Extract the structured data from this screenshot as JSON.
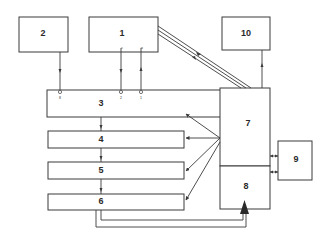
{
  "diagram": {
    "type": "block-diagram",
    "colors": {
      "stroke": "#3a3a3a",
      "background": "#ffffff",
      "text": "#2a2a2a"
    },
    "blocks": [
      {
        "id": "1",
        "label": "1"
      },
      {
        "id": "2",
        "label": "2"
      },
      {
        "id": "3",
        "label": "3"
      },
      {
        "id": "4",
        "label": "4"
      },
      {
        "id": "5",
        "label": "5"
      },
      {
        "id": "6",
        "label": "6"
      },
      {
        "id": "7",
        "label": "7"
      },
      {
        "id": "8",
        "label": "8"
      },
      {
        "id": "9",
        "label": "9"
      },
      {
        "id": "10",
        "label": "10"
      }
    ],
    "ports": {
      "p8": "8",
      "p2": "2",
      "p1": "1",
      "p_src_c": "c",
      "p_src_d": "o"
    },
    "connections": [
      {
        "from": "2",
        "to": "3",
        "port": "8"
      },
      {
        "from": "1",
        "to": "3",
        "port": "2"
      },
      {
        "from": "1",
        "to": "3",
        "port": "1"
      },
      {
        "from": "1",
        "to": "7",
        "bus": 3,
        "bidirectional": true
      },
      {
        "from": "7",
        "to": "10"
      },
      {
        "from": "7",
        "to": "3"
      },
      {
        "from": "7",
        "to": "4"
      },
      {
        "from": "7",
        "to": "5"
      },
      {
        "from": "7",
        "to": "6"
      },
      {
        "from": "3",
        "to": "4"
      },
      {
        "from": "4",
        "to": "5"
      },
      {
        "from": "5",
        "to": "6"
      },
      {
        "from": "6",
        "to": "8",
        "lines": 2
      },
      {
        "from": "7",
        "to": "9",
        "bidirectional": true
      },
      {
        "from": "8",
        "to": "9",
        "bidirectional": true
      }
    ]
  }
}
